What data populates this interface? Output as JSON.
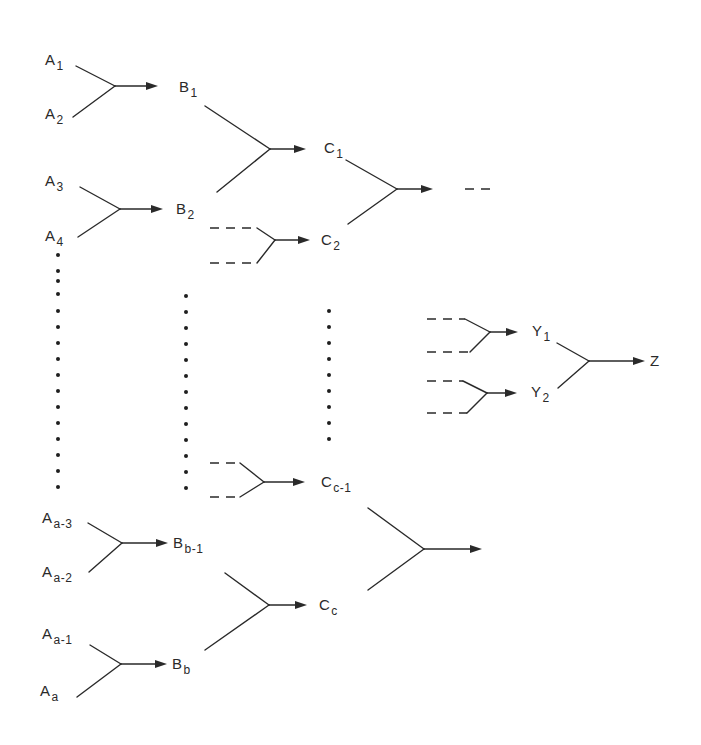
{
  "diagram": {
    "type": "hierarchical merge tree",
    "colors": {
      "ink": "#2a2a2a",
      "background": "#ffffff"
    },
    "nodes": [
      {
        "id": "A1",
        "base": "A",
        "sub": "1",
        "x": 45,
        "y": 52
      },
      {
        "id": "A2",
        "base": "A",
        "sub": "2",
        "x": 45,
        "y": 106
      },
      {
        "id": "A3",
        "base": "A",
        "sub": "3",
        "x": 45,
        "y": 173
      },
      {
        "id": "A4",
        "base": "A",
        "sub": "4",
        "x": 45,
        "y": 228
      },
      {
        "id": "Aa-3",
        "base": "A",
        "sub": "a-3",
        "x": 42,
        "y": 510
      },
      {
        "id": "Aa-2",
        "base": "A",
        "sub": "a-2",
        "x": 42,
        "y": 564
      },
      {
        "id": "Aa-1",
        "base": "A",
        "sub": "a-1",
        "x": 42,
        "y": 626
      },
      {
        "id": "Aa",
        "base": "A",
        "sub": "a",
        "x": 40,
        "y": 683
      },
      {
        "id": "B1",
        "base": "B",
        "sub": "1",
        "x": 179,
        "y": 79
      },
      {
        "id": "B2",
        "base": "B",
        "sub": "2",
        "x": 176,
        "y": 201
      },
      {
        "id": "Bb-1",
        "base": "B",
        "sub": "b-1",
        "x": 173,
        "y": 535
      },
      {
        "id": "Bb",
        "base": "B",
        "sub": "b",
        "x": 172,
        "y": 656
      },
      {
        "id": "C1",
        "base": "C",
        "sub": "1",
        "x": 324,
        "y": 140
      },
      {
        "id": "C2",
        "base": "C",
        "sub": "2",
        "x": 321,
        "y": 232
      },
      {
        "id": "Cc-1",
        "base": "C",
        "sub": "c-1",
        "x": 321,
        "y": 474
      },
      {
        "id": "Cc",
        "base": "C",
        "sub": "c",
        "x": 319,
        "y": 597
      },
      {
        "id": "Y1",
        "base": "Y",
        "sub": "1",
        "x": 532,
        "y": 323
      },
      {
        "id": "Y2",
        "base": "Y",
        "sub": "2",
        "x": 531,
        "y": 384
      },
      {
        "id": "Z",
        "base": "Z",
        "sub": "",
        "x": 650,
        "y": 353
      }
    ],
    "merges": [
      {
        "name": "merge-A1-A2",
        "top": [
          76,
          66,
          115,
          86
        ],
        "bottom": [
          73,
          117,
          115,
          86
        ],
        "arrow": [
          115,
          86,
          158
        ],
        "dashed": false
      },
      {
        "name": "merge-A3-A4",
        "top": [
          80,
          187,
          120,
          209
        ],
        "bottom": [
          78,
          237,
          120,
          209
        ],
        "arrow": [
          120,
          209,
          163
        ],
        "dashed": false
      },
      {
        "name": "merge-B1-B2",
        "top": [
          205,
          106,
          270,
          149
        ],
        "bottom": [
          217,
          192,
          270,
          149
        ],
        "arrow": [
          270,
          149,
          306
        ],
        "dashed": false
      },
      {
        "name": "merge-to-C2",
        "top": [
          257,
          228,
          275,
          240
        ],
        "bottom": [
          257,
          263,
          275,
          240
        ],
        "arrow": [
          275,
          240,
          310
        ],
        "dashed": true,
        "dashTop": [
          210,
          228,
          257,
          228
        ],
        "dashBottom": [
          210,
          263,
          257,
          263
        ]
      },
      {
        "name": "merge-C1-C2",
        "top": [
          346,
          160,
          397,
          189
        ],
        "bottom": [
          348,
          224,
          397,
          189
        ],
        "arrow": [
          397,
          189,
          433
        ],
        "dashed": false
      },
      {
        "name": "merge-to-Y1",
        "top": [
          465,
          319,
          490,
          332
        ],
        "bottom": [
          470,
          352,
          490,
          332
        ],
        "arrow": [
          490,
          332,
          518
        ],
        "dashed": true,
        "dashTop": [
          427,
          319,
          465,
          319
        ],
        "dashBottom": [
          427,
          352,
          470,
          352
        ]
      },
      {
        "name": "merge-to-Y2",
        "top": [
          463,
          381,
          487,
          393
        ],
        "bottom": [
          467,
          413,
          487,
          393
        ],
        "arrow": [
          487,
          393,
          517
        ],
        "dashed": true,
        "dashTop": [
          427,
          381,
          463,
          381
        ],
        "dashBottom": [
          427,
          413,
          467,
          413
        ]
      },
      {
        "name": "merge-Y1-Y2",
        "top": [
          557,
          343,
          589,
          361
        ],
        "bottom": [
          558,
          388,
          589,
          361
        ],
        "arrow": [
          589,
          361,
          645
        ],
        "dashed": false
      },
      {
        "name": "merge-to-Cc-1",
        "top": [
          240,
          463,
          264,
          482
        ],
        "bottom": [
          240,
          497,
          264,
          482
        ],
        "arrow": [
          264,
          482,
          305
        ],
        "dashed": true,
        "dashTop": [
          210,
          463,
          240,
          463
        ],
        "dashBottom": [
          210,
          497,
          240,
          497
        ]
      },
      {
        "name": "merge-Aa3-Aa2",
        "top": [
          88,
          523,
          122,
          543
        ],
        "bottom": [
          89,
          572,
          122,
          543
        ],
        "arrow": [
          122,
          543,
          168
        ],
        "dashed": false
      },
      {
        "name": "merge-Aa1-Aa",
        "top": [
          90,
          645,
          121,
          664
        ],
        "bottom": [
          77,
          697,
          121,
          664
        ],
        "arrow": [
          121,
          664,
          167
        ],
        "dashed": false
      },
      {
        "name": "merge-Bb1-Bb",
        "top": [
          225,
          573,
          269,
          605
        ],
        "bottom": [
          205,
          650,
          269,
          605
        ],
        "arrow": [
          269,
          605,
          307
        ],
        "dashed": false
      },
      {
        "name": "merge-Cc1-Cc",
        "top": [
          368,
          508,
          424,
          549
        ],
        "bottom": [
          368,
          590,
          424,
          549
        ],
        "arrow": [
          424,
          549,
          482
        ],
        "dashed": false
      }
    ],
    "continuation_dashes": [
      {
        "name": "continuation-after-C",
        "x1": 465,
        "y1": 189,
        "x2": 494,
        "y2": 189
      }
    ],
    "ellipsis_columns": [
      {
        "name": "ellipsis-column-A",
        "x": 58,
        "ys": [
          255,
          271,
          281,
          294,
          311,
          327,
          343,
          359,
          375,
          391,
          407,
          423,
          439,
          455,
          471,
          487
        ]
      },
      {
        "name": "ellipsis-column-B",
        "x": 186,
        "ys": [
          296,
          312,
          328,
          344,
          360,
          376,
          392,
          408,
          424,
          440,
          456,
          472,
          488
        ]
      },
      {
        "name": "ellipsis-column-C",
        "x": 329,
        "ys": [
          311,
          327,
          343,
          359,
          375,
          391,
          407,
          423,
          439
        ]
      }
    ]
  }
}
